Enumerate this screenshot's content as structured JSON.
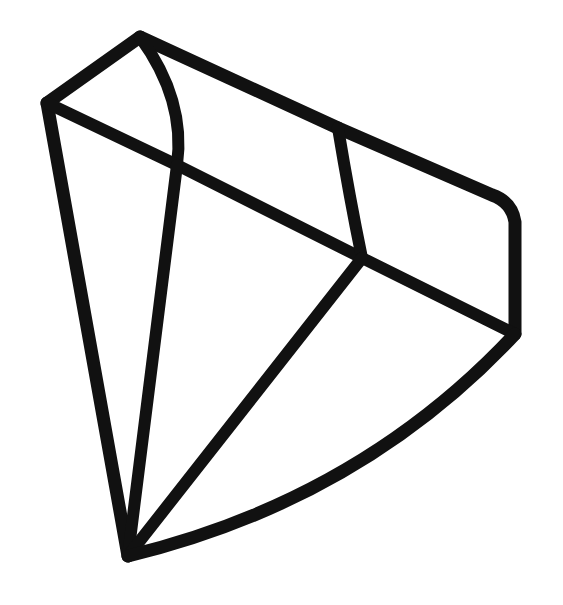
{
  "page": {
    "background_color": "#ffffff",
    "width": 563,
    "height": 605
  },
  "illustration": {
    "name": "diamond-gem-outline",
    "description": "Hand-drawn black outline drawing of a faceted diamond / gemstone viewed at a three-quarter angle",
    "style": "monoline hand-drawn sketch",
    "stroke_color": "#111111",
    "fill_color": "none",
    "stroke_width": 13,
    "stroke_width_thin": 11,
    "vertices": {
      "crown_apex_top": "140,37",
      "crown_left_corner": "47,103",
      "crown_right_corner": "338,128",
      "crown_far_right_corner": "505,201",
      "table_left_junction": "177,165",
      "girdle_center_junction": "362,258",
      "girdle_far_right": "515,334",
      "pavilion_tip": "128,556"
    },
    "facets": [
      "crown-left-triangle",
      "crown-top-curved-facet",
      "crown-table-facet",
      "crown-right-facet",
      "crown-far-right-facet",
      "pavilion-left-facet",
      "pavilion-center-facet",
      "pavilion-right-facet",
      "pavilion-far-right-facet"
    ],
    "paths": {
      "crown_outline_top_left": "M 47 103 L 140 37",
      "crown_outline_top_right": "M 140 37 L 338 128",
      "crown_outline_far_right": "M 338 128 L 492 195 Q 512 202 515 222 L 515 334",
      "left_body_edge": "M 47 103 L 128 556",
      "crown_curved_rib": "M 140 37 Q 186 100 177 165",
      "table_lower_left": "M 47 103 L 177 165",
      "table_lower_right": "M 177 165 L 362 258",
      "crown_right_curved_rib": "M 338 128 Q 350 200 362 258",
      "girdle_right": "M 362 258 L 515 334",
      "pavilion_left_rib": "M 177 165 L 128 556",
      "pavilion_center_rib": "M 362 258 L 128 556",
      "pavilion_bottom_curve": "M 128 556 Q 360 500 515 334"
    }
  }
}
